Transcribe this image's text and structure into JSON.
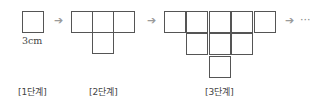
{
  "stages": [
    {
      "label": "[1단계]",
      "cells": [
        [
          0,
          0
        ]
      ]
    },
    {
      "label": "[2단계]",
      "cells": [
        [
          0,
          0
        ],
        [
          1,
          0
        ],
        [
          2,
          0
        ],
        [
          1,
          1
        ]
      ]
    },
    {
      "label": "[3단계]",
      "cells": [
        [
          0,
          0
        ],
        [
          1,
          0
        ],
        [
          2,
          0
        ],
        [
          3,
          0
        ],
        [
          4,
          0
        ],
        [
          1,
          1
        ],
        [
          2,
          1
        ],
        [
          3,
          1
        ],
        [
          2,
          2
        ]
      ]
    }
  ],
  "dimension_label": "3cm",
  "arrow_glyph": "➔",
  "continuation": "···"
}
